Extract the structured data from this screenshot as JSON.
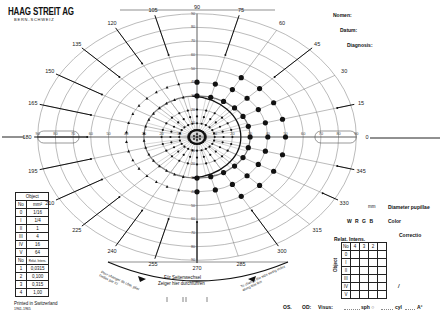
{
  "header": {
    "brand": "HAAG STREIT AG",
    "brand_sub": "BERN-SCHWEIZ",
    "fields": [
      {
        "label": "Nomen:"
      },
      {
        "label": "Datum:"
      },
      {
        "label": "Diagnosis:"
      }
    ]
  },
  "right_panel": {
    "pupil_unit": "mm",
    "pupil_label": "Diameter pupillae",
    "color_options": "W  R  G  B",
    "color_label": "Color",
    "correction_label": "Correctio",
    "relat_intens_label": "Relat. Intens.",
    "relat_intens_table": {
      "header": [
        "No",
        "4",
        "3",
        "2",
        ""
      ],
      "rows": [
        "0",
        "I",
        "II",
        "III",
        "IV",
        "V"
      ],
      "side_label": "Object"
    },
    "slash_mark": "/"
  },
  "object_table": {
    "title": "Object",
    "head1": [
      "No",
      "mm²"
    ],
    "rows1": [
      [
        "0",
        "1/16"
      ],
      [
        "I",
        "1/4"
      ],
      [
        "II",
        "1"
      ],
      [
        "III",
        "4"
      ],
      [
        "IV",
        "16"
      ],
      [
        "V",
        "64"
      ]
    ],
    "head2": [
      "No",
      "Relat. Intens."
    ],
    "rows2": [
      [
        "1",
        "0,0315"
      ],
      [
        "2",
        "0,100"
      ],
      [
        "3",
        "0,315"
      ],
      [
        "4",
        "1,00"
      ]
    ]
  },
  "footer": {
    "printed": "Printed in Switzerland",
    "code": "1961-1965",
    "os_label": "OS.",
    "od_label": "OD:",
    "visus_label": "Visus:",
    "sph_label": "sph ○",
    "cyl_label": "cyl",
    "axis_label": "A°"
  },
  "bottom_notes": {
    "left_arc_text": "Pour changer de côté, plier l'index par ici",
    "center_text_1": "Für Seitenwechsel",
    "center_text_2": "Zeiger hier durchführen",
    "right_arc_text": "To change the side swing index along this line"
  },
  "chart_data": {
    "type": "polar-perimetry",
    "meridian_labels": [
      "0",
      "15",
      "30",
      "45",
      "60",
      "75",
      "90",
      "105",
      "120",
      "135",
      "150",
      "165",
      "180",
      "195",
      "210",
      "225",
      "240",
      "255",
      "270",
      "285",
      "300",
      "315",
      "330",
      "345"
    ],
    "ring_degrees": [
      10,
      20,
      30,
      40,
      50,
      60,
      70,
      80,
      90
    ],
    "horizontal_ticks": [
      "10",
      "20",
      "30",
      "40",
      "50",
      "60",
      "70",
      "80",
      "90"
    ],
    "vertical_ticks": [
      "10",
      "20",
      "30",
      "40",
      "50",
      "60",
      "70",
      "80",
      "90"
    ],
    "blind_spot_box": {
      "from_deg": 70,
      "to_deg": 90,
      "side": "both"
    },
    "isopter_large_dots_right": {
      "description": "Large dots forming isopter arcs in temporal (right) hemifield",
      "ring1_radius_deg": 30,
      "ring2_radius_deg": 40,
      "ring3_radius_deg": 50,
      "meridians": [
        0,
        15,
        30,
        45,
        60,
        75,
        90,
        270,
        285,
        300,
        315,
        330,
        345
      ]
    },
    "central_dots": {
      "description": "Small dots around central 10-20° rings",
      "radii_deg": [
        5,
        10,
        15,
        20
      ]
    },
    "left_triangles": {
      "description": "Triangle markers in nasal (left) field",
      "radii_deg": [
        30,
        40
      ]
    },
    "vectors": {
      "description": "Arrow vectors pointing inward from periphery",
      "meridians": [
        105,
        120,
        135,
        150,
        165,
        180,
        195,
        210,
        225,
        240,
        255,
        270,
        300,
        330,
        345,
        15,
        45,
        75
      ]
    }
  }
}
